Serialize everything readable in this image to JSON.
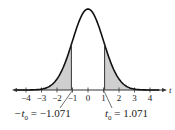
{
  "diagram": {
    "type": "t-distribution",
    "axis_label": "t",
    "ticks": [
      {
        "value": -4,
        "label": "−4"
      },
      {
        "value": -3,
        "label": "−3"
      },
      {
        "value": -2,
        "label": "−2"
      },
      {
        "value": -1,
        "label": "−1"
      },
      {
        "value": 0,
        "label": "0"
      },
      {
        "value": 1,
        "label": "1"
      },
      {
        "value": 2,
        "label": "2"
      },
      {
        "value": 3,
        "label": "3"
      },
      {
        "value": 4,
        "label": "4"
      }
    ],
    "critical_values": {
      "left": {
        "symbol": "−t",
        "subscript": "0",
        "equals": " = −1.071",
        "value": -1.071
      },
      "right": {
        "symbol": "t",
        "subscript": "0",
        "equals": " = 1.071",
        "value": 1.071
      }
    },
    "shaded_regions": "tails",
    "colors": {
      "curve": "#111111",
      "shade": "#cfcfcf",
      "axis": "#333333"
    }
  }
}
